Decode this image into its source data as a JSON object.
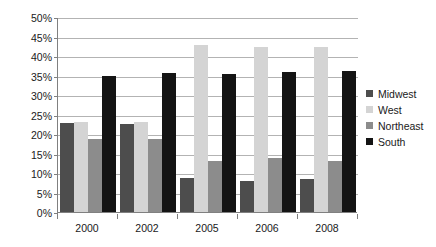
{
  "chart_data": {
    "type": "bar",
    "title": "",
    "subtitle": "",
    "xlabel": "",
    "ylabel": "",
    "categories": [
      "2000",
      "2002",
      "2005",
      "2006",
      "2008"
    ],
    "series": [
      {
        "name": "Midwest",
        "color": "#4d4d4d",
        "values": [
          22.8,
          22.5,
          8.7,
          8.0,
          8.4
        ]
      },
      {
        "name": "West",
        "color": "#d4d4d4",
        "values": [
          23.1,
          23.1,
          42.8,
          42.2,
          42.2
        ]
      },
      {
        "name": "Northeast",
        "color": "#8c8c8c",
        "values": [
          18.7,
          18.7,
          13.0,
          13.8,
          13.0
        ]
      },
      {
        "name": "South",
        "color": "#141414",
        "values": [
          35.0,
          35.6,
          35.4,
          36.0,
          36.2
        ]
      }
    ],
    "ylim": [
      0,
      50
    ],
    "ytick_values": [
      0,
      5,
      10,
      15,
      20,
      25,
      30,
      35,
      40,
      45,
      50
    ],
    "ytick_labels": [
      "0%",
      "5%",
      "10%",
      "15%",
      "20%",
      "25%",
      "30%",
      "35%",
      "40%",
      "45%",
      "50%"
    ],
    "grid": true,
    "grid_color": "#b3b3b3",
    "axis_color": "#808080",
    "background": "#ffffff",
    "legend_position": "right",
    "legend_entries": [
      "Midwest",
      "West",
      "Northeast",
      "South"
    ]
  }
}
